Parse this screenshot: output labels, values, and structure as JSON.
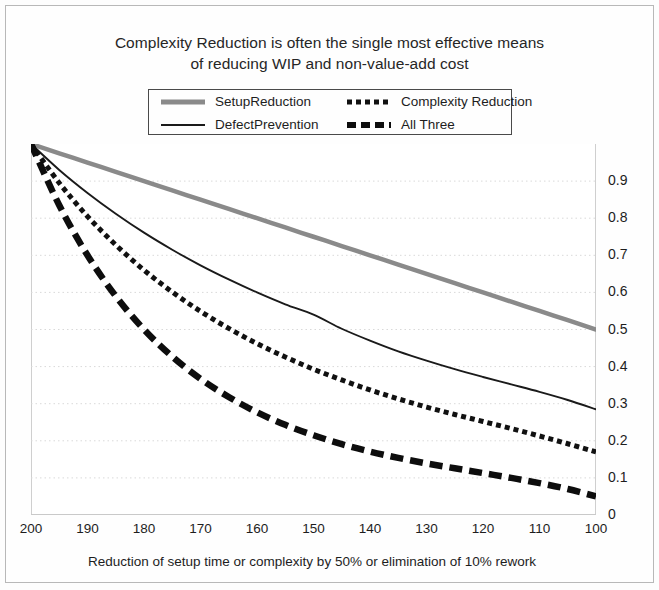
{
  "chart_data": {
    "type": "line",
    "title": "Complexity Reduction is often the single most effective means of reducing WIP and non-value-add cost",
    "title_line1": "Complexity Reduction is often the single most effective means",
    "title_line2": "of reducing WIP and non-value-add cost",
    "xlabel": "Reduction of setup time or complexity by 50% or elimination of 10% rework",
    "ylabel": "",
    "xlim": [
      200,
      100
    ],
    "ylim": [
      0,
      1
    ],
    "x_tick_labels": [
      "200",
      "190",
      "180",
      "170",
      "160",
      "150",
      "140",
      "130",
      "120",
      "110",
      "100"
    ],
    "y_tick_labels": [
      "0.9",
      "0.8",
      "0.7",
      "0.6",
      "0.5",
      "0.4",
      "0.3",
      "0.2",
      "0.1",
      "0"
    ],
    "y_tick_values": [
      0.9,
      0.8,
      0.7,
      0.6,
      0.5,
      0.4,
      0.3,
      0.2,
      0.1,
      0
    ],
    "y_axis_position": "right",
    "grid": "horizontal-dotted",
    "legend_position": "top-center",
    "x": [
      200,
      195,
      190,
      185,
      180,
      175,
      170,
      165,
      160,
      155,
      150,
      145,
      140,
      135,
      130,
      125,
      120,
      115,
      110,
      105,
      100
    ],
    "series": [
      {
        "name": "SetupReduction",
        "style": "solid-thick-gray",
        "color": "#8a8a8a",
        "values": [
          1.0,
          0.975,
          0.95,
          0.925,
          0.9,
          0.875,
          0.85,
          0.825,
          0.8,
          0.775,
          0.75,
          0.725,
          0.7,
          0.675,
          0.65,
          0.625,
          0.6,
          0.575,
          0.55,
          0.525,
          0.5
        ]
      },
      {
        "name": "DefectPrevention",
        "style": "solid-thin-black",
        "color": "#1a1a1a",
        "values": [
          1.0,
          0.93,
          0.868,
          0.812,
          0.761,
          0.715,
          0.673,
          0.635,
          0.6,
          0.568,
          0.54,
          0.502,
          0.47,
          0.441,
          0.416,
          0.393,
          0.372,
          0.352,
          0.332,
          0.31,
          0.285
        ]
      },
      {
        "name": "Complexity Reduction",
        "style": "dotted-black",
        "color": "#111111",
        "values": [
          1.0,
          0.895,
          0.805,
          0.728,
          0.66,
          0.601,
          0.549,
          0.503,
          0.462,
          0.426,
          0.393,
          0.364,
          0.337,
          0.313,
          0.291,
          0.271,
          0.252,
          0.233,
          0.213,
          0.192,
          0.17
        ]
      },
      {
        "name": "All Three",
        "style": "dashed-thick-black",
        "color": "#0d0d0d",
        "values": [
          1.0,
          0.835,
          0.7,
          0.59,
          0.5,
          0.427,
          0.367,
          0.318,
          0.277,
          0.243,
          0.215,
          0.191,
          0.171,
          0.154,
          0.139,
          0.126,
          0.113,
          0.1,
          0.086,
          0.07,
          0.05
        ]
      }
    ]
  },
  "legend": {
    "entries": [
      {
        "label": "SetupReduction",
        "sample": "solid-thick-gray-sample"
      },
      {
        "label": "Complexity Reduction",
        "sample": "dotted-black-sample"
      },
      {
        "label": "DefectPrevention",
        "sample": "solid-thin-black-sample"
      },
      {
        "label": "All Three",
        "sample": "dashed-thick-black-sample"
      }
    ]
  },
  "colors": {
    "setup_reduction": "#8a8a8a",
    "defect_prevention": "#1a1a1a",
    "complexity_reduction": "#111111",
    "all_three": "#0d0d0d",
    "grid": "#d9d9d9",
    "frame": "#b8b8b8",
    "text": "#1d1d1d"
  }
}
